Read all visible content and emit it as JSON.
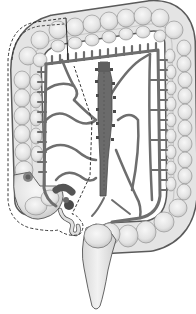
{
  "diagram": {
    "type": "anatomical-illustration",
    "style": "grayscale line illustration",
    "structures": [
      {
        "id": "ascending-colon",
        "label": "Ascending colon"
      },
      {
        "id": "transverse-colon",
        "label": "Transverse colon"
      },
      {
        "id": "descending-colon",
        "label": "Descending colon"
      },
      {
        "id": "sigmoid-colon",
        "label": "Sigmoid colon"
      },
      {
        "id": "rectum",
        "label": "Rectum"
      },
      {
        "id": "cecum",
        "label": "Cecum"
      },
      {
        "id": "appendix",
        "label": "Appendix"
      },
      {
        "id": "terminal-ileum",
        "label": "Terminal ileum"
      },
      {
        "id": "mesenteric-vessels",
        "label": "Mesenteric arterial arcades"
      },
      {
        "id": "superior-mesenteric-trunk",
        "label": "Central mesenteric trunk"
      },
      {
        "id": "tumor",
        "label": "Lesion on ascending colon"
      },
      {
        "id": "resection-line",
        "label": "Dashed resection boundary"
      }
    ],
    "colors": {
      "background": "#ffffff",
      "bowel_fill": "#e6e6e6",
      "bowel_highlight": "#f4f4f4",
      "bowel_outline": "#555555",
      "vessel": "#6e6e6e",
      "vessel_dark": "#4a4a4a",
      "tumor": "#7a7a7a",
      "dashed_line": "#222222"
    }
  }
}
